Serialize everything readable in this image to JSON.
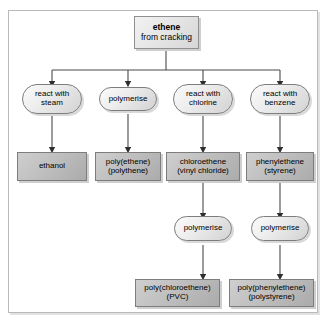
{
  "diagram": {
    "type": "flowchart",
    "background_color": "#ffffff",
    "frame_color": "#b9b9b9",
    "node_fill_light": "#e6e6e6",
    "node_fill_gray": "#bdbdbd",
    "node_border": "#7d7d7d",
    "connector_color": "#404040"
  },
  "start": {
    "title": "ethene",
    "subtitle": "from cracking"
  },
  "processes_row1": [
    {
      "line1": "react with",
      "line2": "steam"
    },
    {
      "line1": "polymerise",
      "line2": ""
    },
    {
      "line1": "react with",
      "line2": "chlorine"
    },
    {
      "line1": "react with",
      "line2": "benzene"
    }
  ],
  "products_row1": [
    {
      "line1": "ethanol",
      "line2": ""
    },
    {
      "line1": "poly(ethene)",
      "line2": "(polythene)"
    },
    {
      "line1": "chloroethene",
      "line2": "(vinyl chloride)"
    },
    {
      "line1": "phenylethene",
      "line2": "(styrene)"
    }
  ],
  "processes_row2": [
    {
      "line1": "polymerise",
      "line2": ""
    },
    {
      "line1": "polymerise",
      "line2": ""
    }
  ],
  "products_row2": [
    {
      "line1": "poly(chloroethene)",
      "line2": "(PVC)"
    },
    {
      "line1": "poly(phenylethene)",
      "line2": "(polystyrene)"
    }
  ]
}
